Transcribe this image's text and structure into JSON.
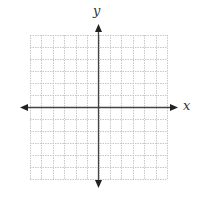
{
  "diagram": {
    "type": "coordinate-plane",
    "x_axis_label": "x",
    "y_axis_label": "y",
    "grid": {
      "columns": 12,
      "rows": 12,
      "left": 30,
      "top": 35,
      "right": 167,
      "bottom": 179,
      "line_color": "#c8c8c8",
      "line_style": "dotted"
    },
    "axes": {
      "origin_x": 98,
      "origin_y": 107,
      "x_start": 20,
      "x_end": 178,
      "y_start": 24,
      "y_end": 188,
      "color": "#444444"
    }
  }
}
